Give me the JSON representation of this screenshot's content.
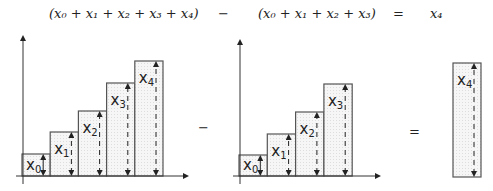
{
  "equation": {
    "term_left": "(x₀ + x₁ + x₂ + x₃ + x₄)",
    "operator_minus": "−",
    "term_middle": "(x₀ + x₁ + x₂ + x₃)",
    "operator_equals": "=",
    "term_right": "x₄"
  },
  "diagram": {
    "between_operator_minus": "−",
    "between_operator_equals": "=",
    "colors": {
      "bar_fill": "#f1f1f1",
      "stroke": "#555555",
      "arrow": "#222222"
    },
    "left_chart": {
      "bars": [
        {
          "label": "x",
          "sub": "0",
          "height": 22
        },
        {
          "label": "x",
          "sub": "1",
          "height": 44
        },
        {
          "label": "x",
          "sub": "2",
          "height": 65
        },
        {
          "label": "x",
          "sub": "3",
          "height": 93
        },
        {
          "label": "x",
          "sub": "4",
          "height": 115
        }
      ]
    },
    "middle_chart": {
      "bars": [
        {
          "label": "x",
          "sub": "0",
          "height": 21
        },
        {
          "label": "x",
          "sub": "1",
          "height": 42
        },
        {
          "label": "x",
          "sub": "2",
          "height": 64
        },
        {
          "label": "x",
          "sub": "3",
          "height": 92
        }
      ]
    },
    "result_bar": {
      "label": "x",
      "sub": "4",
      "height": 114
    }
  }
}
